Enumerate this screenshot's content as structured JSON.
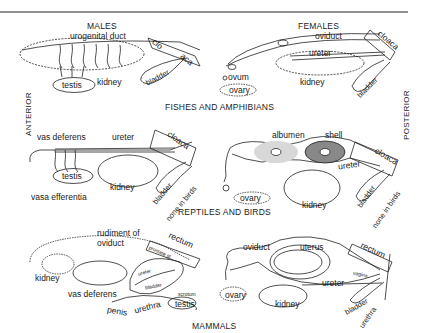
{
  "figure": {
    "column_headers": {
      "males": "MALES",
      "females": "FEMALES"
    },
    "axis_labels": {
      "left": "ANTERIOR",
      "right": "POSTERIOR"
    },
    "rows": [
      {
        "title": "FISHES AND AMPHIBIANS",
        "males": {
          "labels": [
            "urogenital duct",
            "clo",
            "aca",
            "testis",
            "kidney",
            "bladder"
          ]
        },
        "females": {
          "labels": [
            "oviduct",
            "ureter",
            "cloaca",
            "ovum",
            "ovary",
            "kidney",
            "bladder"
          ]
        }
      },
      {
        "title": "REPTILES AND BIRDS",
        "males": {
          "labels": [
            "vas deferens",
            "ureter",
            "cloaca",
            "testis",
            "kidney",
            "bladder",
            "none in birds",
            "vasa efferentia"
          ]
        },
        "females": {
          "labels": [
            "albumen",
            "shell",
            "ureter",
            "cloaca",
            "ovary",
            "kidney",
            "bladder",
            "none in birds"
          ]
        }
      },
      {
        "title": "MAMMALS",
        "males": {
          "labels": [
            "rudiment of",
            "oviduct",
            "rectum",
            "prostate gl.",
            "ureter",
            "bladder",
            "kidney",
            "vas deferens",
            "scrotum",
            "testis",
            "penis",
            "urethra"
          ]
        },
        "females": {
          "labels": [
            "oviduct",
            "uterus",
            "rectum",
            "vagina",
            "ureter",
            "ovary",
            "kidney",
            "bladder",
            "urethra"
          ]
        }
      }
    ]
  }
}
